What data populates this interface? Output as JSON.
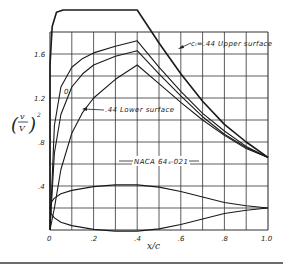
{
  "chart_data": {
    "type": "line",
    "title": "",
    "xlabel": "x/c",
    "ylabel": "(v/V)^2",
    "xlim": [
      0,
      1.0
    ],
    "ylim": [
      0,
      1.8
    ],
    "grid": true,
    "x_ticks": [
      "0",
      ".2",
      ".4",
      ".6",
      ".8",
      "1.0"
    ],
    "y_ticks": [
      ".4",
      ".8",
      "1.2",
      "1.6"
    ],
    "annotations": {
      "upper": "cₗ=.44 Upper surface",
      "lower": ".44 Lower surface",
      "zero": "0",
      "profile": "NACA 64₄-021"
    },
    "series": [
      {
        "name": "Design envelope (flat-top)",
        "x": [
          0.0,
          0.01,
          0.03,
          0.06,
          0.1,
          0.2,
          0.3,
          0.4,
          0.5,
          0.6,
          0.7,
          0.8,
          0.9,
          1.0
        ],
        "values": [
          1.5,
          1.85,
          1.98,
          2.0,
          2.0,
          2.0,
          2.0,
          2.0,
          1.7,
          1.42,
          1.17,
          0.96,
          0.8,
          0.66
        ]
      },
      {
        "name": "c_l = .44 Upper surface",
        "x": [
          0.0,
          0.02,
          0.05,
          0.1,
          0.15,
          0.2,
          0.3,
          0.4,
          0.5,
          0.6,
          0.7,
          0.8,
          0.9,
          1.0
        ],
        "values": [
          0.0,
          0.95,
          1.3,
          1.48,
          1.56,
          1.61,
          1.67,
          1.72,
          1.48,
          1.26,
          1.06,
          0.9,
          0.76,
          0.66
        ]
      },
      {
        "name": "c_l = 0",
        "x": [
          0.0,
          0.02,
          0.05,
          0.1,
          0.15,
          0.2,
          0.3,
          0.4,
          0.5,
          0.6,
          0.7,
          0.8,
          0.9,
          1.0
        ],
        "values": [
          0.0,
          0.7,
          1.05,
          1.3,
          1.42,
          1.5,
          1.58,
          1.63,
          1.42,
          1.22,
          1.03,
          0.87,
          0.75,
          0.66
        ]
      },
      {
        "name": "c_l = .44 Lower surface",
        "x": [
          0.0,
          0.02,
          0.05,
          0.1,
          0.15,
          0.2,
          0.3,
          0.4,
          0.5,
          0.6,
          0.7,
          0.8,
          0.9,
          1.0
        ],
        "values": [
          0.0,
          0.2,
          0.55,
          0.88,
          1.07,
          1.2,
          1.37,
          1.5,
          1.33,
          1.16,
          1.0,
          0.86,
          0.74,
          0.66
        ]
      },
      {
        "name": "NACA 64₄-021 profile (upper)",
        "x": [
          0.0,
          0.005,
          0.02,
          0.05,
          0.1,
          0.2,
          0.3,
          0.4,
          0.5,
          0.6,
          0.7,
          0.8,
          0.9,
          1.0
        ],
        "values": [
          0.2,
          0.25,
          0.29,
          0.33,
          0.36,
          0.395,
          0.41,
          0.41,
          0.39,
          0.35,
          0.3,
          0.25,
          0.22,
          0.2
        ]
      },
      {
        "name": "NACA 64₄-021 profile (lower)",
        "x": [
          0.0,
          0.005,
          0.02,
          0.05,
          0.1,
          0.2,
          0.3,
          0.4,
          0.5,
          0.6,
          0.7,
          0.8,
          0.9,
          1.0
        ],
        "values": [
          0.2,
          0.15,
          0.11,
          0.07,
          0.04,
          0.005,
          -0.01,
          -0.01,
          0.01,
          0.05,
          0.1,
          0.15,
          0.18,
          0.2
        ]
      }
    ]
  }
}
